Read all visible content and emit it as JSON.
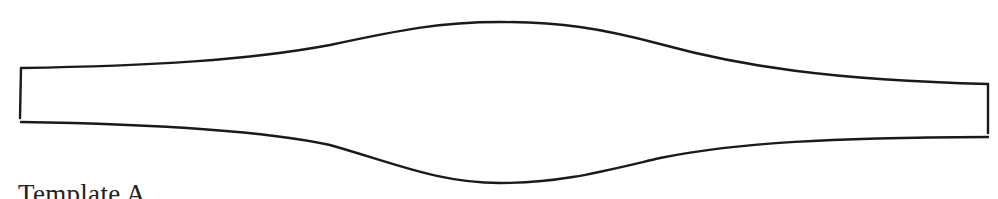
{
  "diagram": {
    "caption": "Template A",
    "stroke_color": "#1a1a1a",
    "background": "#ffffff",
    "shape": {
      "type": "lens-template-outline",
      "left_edge": {
        "x": 21,
        "y_top": 68,
        "y_bottom": 118
      },
      "right_edge": {
        "x": 988,
        "y_top": 84,
        "y_bottom": 137
      },
      "top_peak": {
        "x": 500,
        "y": 22
      },
      "bottom_trough": {
        "x": 500,
        "y": 183
      }
    }
  }
}
